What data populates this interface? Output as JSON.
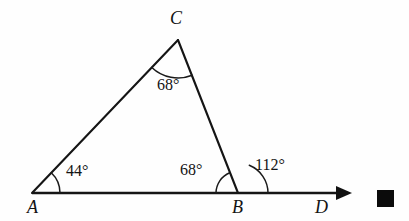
{
  "figure": {
    "kind": "geometry-diagram",
    "background_color": "#fefefe",
    "stroke_color": "#151515",
    "degree_symbol": "°"
  },
  "vertices": {
    "a": {
      "label": "A",
      "x": 32,
      "y": 193,
      "label_x": 27,
      "label_y": 213
    },
    "b": {
      "label": "B",
      "x": 238,
      "y": 193,
      "label_x": 232,
      "label_y": 213
    },
    "c": {
      "label": "C",
      "x": 178,
      "y": 40,
      "label_x": 170,
      "label_y": 24
    },
    "d": {
      "label": "D",
      "x": 348,
      "y": 193,
      "label_x": 315,
      "label_y": 213
    }
  },
  "angles": [
    {
      "id": "angle-a",
      "at_vertex": "A",
      "value": "44°",
      "degrees": 44,
      "arc_radius": 28,
      "label_x": 66,
      "label_y": 176
    },
    {
      "id": "angle-c",
      "at_vertex": "C",
      "value": "68°",
      "degrees": 68,
      "arc_radius": 38,
      "label_x": 157,
      "label_y": 90
    },
    {
      "id": "angle-b-interior",
      "at_vertex": "B",
      "value": "68°",
      "degrees": 68,
      "arc_radius": 22,
      "label_x": 180,
      "label_y": 175
    },
    {
      "id": "angle-b-exterior",
      "at_vertex": "B",
      "value": "112°",
      "degrees": 112,
      "arc_radius": 30,
      "label_x": 255,
      "label_y": 170
    }
  ],
  "segments": [
    {
      "id": "segment-ac",
      "from": "A",
      "to": "C"
    },
    {
      "id": "segment-cb",
      "from": "C",
      "to": "B"
    },
    {
      "id": "ray-ad",
      "from": "A",
      "to": "D",
      "has_arrowhead": true
    }
  ],
  "marks": {
    "qed_square": {
      "x": 377,
      "y": 190,
      "size": 17,
      "color": "#0b0b0b"
    }
  }
}
